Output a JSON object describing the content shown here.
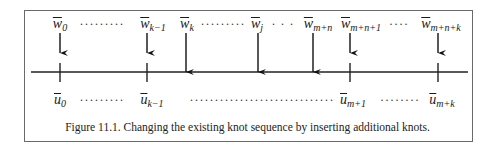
{
  "figure": {
    "caption": "Figure 11.1.  Changing the existing knot sequence by inserting additional knots.",
    "top_labels": [
      {
        "sym": "w",
        "sub": "0",
        "x": 60
      },
      {
        "sym": "w",
        "sub": "k−1",
        "x": 153
      },
      {
        "sym": "w",
        "sub": "k",
        "x": 187
      },
      {
        "sym": "w",
        "sub": "j",
        "x": 257
      },
      {
        "sym": "w",
        "sub": "m+n",
        "x": 318
      },
      {
        "sym": "w",
        "sub": "m+n+1",
        "x": 361
      },
      {
        "sym": "w",
        "sub": "m+n+k",
        "x": 441
      }
    ],
    "top_dots": [
      {
        "text": "·········",
        "x": 102
      },
      {
        "text": "·········",
        "x": 223
      },
      {
        "text": "· · ·",
        "x": 283
      },
      {
        "text": "····",
        "x": 399
      }
    ],
    "bottom_labels": [
      {
        "sym": "u",
        "sub": "0",
        "x": 60
      },
      {
        "sym": "u",
        "sub": "k−1",
        "x": 152
      },
      {
        "sym": "u",
        "sub": "m+1",
        "x": 353
      },
      {
        "sym": "u",
        "sub": "m+k",
        "x": 442
      }
    ],
    "bottom_dots": [
      {
        "text": "·········",
        "x": 102
      },
      {
        "text": "·····························",
        "x": 262
      },
      {
        "text": "········",
        "x": 400
      }
    ],
    "axis": {
      "y": 72,
      "x1": 31,
      "x2": 468
    },
    "ticks_x": [
      60,
      147,
      350,
      438
    ],
    "short_arrows_x": [
      60,
      147,
      350,
      438
    ],
    "long_arrows_x": [
      186,
      258,
      313
    ]
  }
}
